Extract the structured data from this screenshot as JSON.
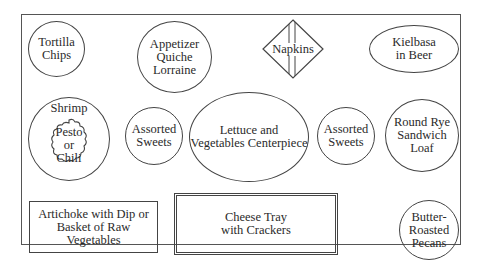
{
  "diagram": {
    "type": "table-layout",
    "items": [
      {
        "id": "tortilla-chips",
        "shape": "circle",
        "lines": [
          "Tortilla",
          "Chips"
        ]
      },
      {
        "id": "quiche",
        "shape": "circle",
        "lines": [
          "Appetizer",
          "Quiche",
          "Lorraine"
        ]
      },
      {
        "id": "napkins",
        "shape": "diamond",
        "lines": [
          "Napkins"
        ]
      },
      {
        "id": "kielbasa",
        "shape": "ellipse",
        "lines": [
          "Kielbasa",
          "in Beer"
        ]
      },
      {
        "id": "shrimp",
        "shape": "circle",
        "lines": [
          "Shrimp"
        ],
        "inner": {
          "shape": "scalloped",
          "lines": [
            "Pesto",
            "or",
            "Chili"
          ]
        }
      },
      {
        "id": "sweets-left",
        "shape": "circle",
        "lines": [
          "Assorted",
          "Sweets"
        ]
      },
      {
        "id": "centerpiece",
        "shape": "ellipse",
        "lines": [
          "Lettuce and",
          "Vegetables Centerpiece"
        ]
      },
      {
        "id": "sweets-right",
        "shape": "circle",
        "lines": [
          "Assorted",
          "Sweets"
        ]
      },
      {
        "id": "rye-loaf",
        "shape": "circle",
        "lines": [
          "Round Rye",
          "Sandwich",
          "Loaf"
        ]
      },
      {
        "id": "artichoke",
        "shape": "rectangle",
        "lines": [
          "Artichoke with Dip or",
          "Basket of Raw Vegetables"
        ]
      },
      {
        "id": "cheese-tray",
        "shape": "double-rectangle",
        "lines": [
          "Cheese Tray",
          "with Crackers"
        ]
      },
      {
        "id": "pecans",
        "shape": "circle",
        "lines": [
          "Butter-",
          "Roasted",
          "Pecans"
        ]
      }
    ]
  }
}
